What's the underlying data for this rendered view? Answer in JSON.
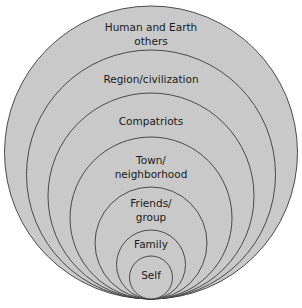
{
  "diagram": {
    "type": "nested-tangent-circles",
    "fill_color": "#c9c9c9",
    "stroke_color": "#3a3a3a",
    "background": "#ffffff",
    "bottom_tangent_y": 299,
    "center_x": 151,
    "circles": [
      {
        "id": "human-earth",
        "lines": [
          "Human and Earth",
          "others"
        ],
        "r": 146.5,
        "label_y": [
          31,
          45
        ]
      },
      {
        "id": "region",
        "lines": [
          "Region/civilization"
        ],
        "r": 124.5,
        "label_y": [
          83
        ]
      },
      {
        "id": "compatriots",
        "lines": [
          "Compatriots"
        ],
        "r": 103,
        "label_y": [
          125
        ]
      },
      {
        "id": "town",
        "lines": [
          "Town/",
          "neighborhood"
        ],
        "r": 81,
        "label_y": [
          164,
          178
        ]
      },
      {
        "id": "friends",
        "lines": [
          "Friends/",
          "group"
        ],
        "r": 56,
        "label_y": [
          207,
          221
        ]
      },
      {
        "id": "family",
        "lines": [
          "Family"
        ],
        "r": 34.5,
        "label_y": [
          248
        ]
      },
      {
        "id": "self",
        "lines": [
          "Self"
        ],
        "r": 21.5,
        "label_y": [
          279
        ]
      }
    ]
  }
}
